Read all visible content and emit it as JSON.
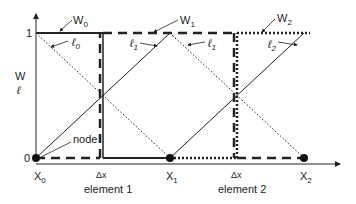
{
  "diagram": {
    "axis": {
      "y_label_top": "W",
      "y_label_bottom": "ℓ",
      "tick_1": "1",
      "tick_0": "0"
    },
    "nodes": [
      {
        "label": "X",
        "sub": "0"
      },
      {
        "label": "X",
        "sub": "1"
      },
      {
        "label": "X",
        "sub": "2"
      }
    ],
    "weight_functions": [
      {
        "label": "W",
        "sub": "0"
      },
      {
        "label": "W",
        "sub": "1"
      },
      {
        "label": "W",
        "sub": "2"
      }
    ],
    "linear_functions": [
      {
        "label": "ℓ",
        "sub": "0"
      },
      {
        "label": "ℓ",
        "sub": "1"
      },
      {
        "label": "ℓ",
        "sub": "1"
      },
      {
        "label": "ℓ",
        "sub": "2"
      }
    ],
    "node_label": "node",
    "dx_labels": [
      "Δx",
      "Δx"
    ],
    "elements": [
      "element 1",
      "element 2"
    ]
  }
}
